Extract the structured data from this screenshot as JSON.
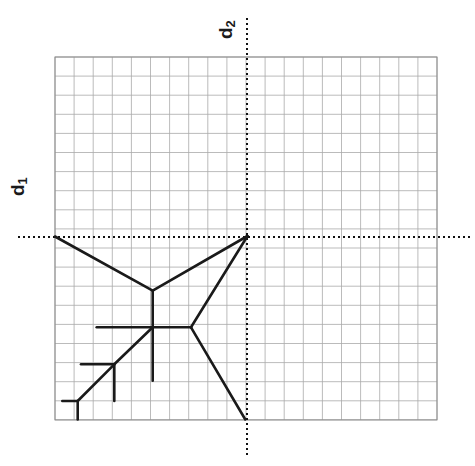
{
  "figure": {
    "width": 475,
    "height": 466,
    "background": "#ffffff",
    "grid": {
      "x0": 55,
      "y0": 57,
      "cell": 19.1,
      "cols": 20,
      "rows": 19,
      "line_color": "#a9a9a9",
      "line_width": 0.8,
      "border_color": "#8c8c8c",
      "border_width": 1.0,
      "visible": true
    },
    "axes": {
      "style": "dotted",
      "color": "#111111",
      "width": 2.0,
      "dash": "2,3",
      "vertical_x": 247,
      "horizontal_y": 237,
      "vertical_top": 18,
      "vertical_bottom": 455,
      "horizontal_left": 18,
      "horizontal_right": 470
    },
    "labels": {
      "d1": {
        "text": "d",
        "sub": "1",
        "rotated": true,
        "rotation_deg": -90
      },
      "d2": {
        "text": "d",
        "sub": "2",
        "rotated": true,
        "rotation_deg": -90
      }
    },
    "diagram": {
      "stroke_color": "#1a1a1a",
      "stroke_width": 2.6,
      "description": "piecewise-linear cell-boundary skeleton in third quadrant"
    }
  },
  "chart_data": {
    "type": "line",
    "title": "",
    "subtitle": "",
    "xlabel": "d2",
    "ylabel": "d1",
    "legend": [],
    "grid": true,
    "grid_cols": 20,
    "grid_rows": 19,
    "axis_origin_px": [
      247,
      237
    ],
    "axis_origin_cell": [
      10.05,
      9.42
    ],
    "xlim_px": [
      55,
      437
    ],
    "ylim_px": [
      57,
      419
    ],
    "annotations": [
      {
        "text": "d1",
        "role": "vertical-axis-label",
        "px": [
          18,
          222
        ]
      },
      {
        "text": "d2",
        "role": "horizontal-axis-label",
        "px": [
          230,
          30
        ]
      }
    ],
    "nodes": [
      {
        "id": "origin",
        "px": [
          247.5,
          236.0
        ],
        "label": ""
      },
      {
        "id": "upper-junction",
        "px": [
          152.7,
          290.7
        ],
        "label": ""
      },
      {
        "id": "center-junction",
        "px": [
          152.7,
          327.3
        ],
        "label": ""
      },
      {
        "id": "right-junction",
        "px": [
          191.0,
          327.3
        ],
        "label": ""
      },
      {
        "id": "lower-left-junction",
        "px": [
          114.3,
          364.3
        ],
        "label": ""
      },
      {
        "id": "bottom-left-junction",
        "px": [
          77.7,
          401.0
        ],
        "label": ""
      }
    ],
    "segments": [
      {
        "name": "edge-left-to-upper",
        "points": [
          [
            55.0,
            236.5
          ],
          [
            152.7,
            290.7
          ]
        ]
      },
      {
        "name": "edge-upper-to-origin",
        "points": [
          [
            152.7,
            290.7
          ],
          [
            247.5,
            236.0
          ]
        ]
      },
      {
        "name": "edge-upper-to-center",
        "points": [
          [
            152.7,
            290.7
          ],
          [
            152.7,
            327.3
          ]
        ]
      },
      {
        "name": "edge-right-to-origin",
        "points": [
          [
            191.0,
            327.3
          ],
          [
            247.5,
            236.0
          ]
        ]
      },
      {
        "name": "edge-center-to-right",
        "points": [
          [
            152.7,
            327.3
          ],
          [
            191.0,
            327.3
          ]
        ]
      },
      {
        "name": "edge-center-to-left-stub",
        "points": [
          [
            152.7,
            327.3
          ],
          [
            96.7,
            327.3
          ]
        ]
      },
      {
        "name": "edge-center-down-stub",
        "points": [
          [
            152.7,
            327.3
          ],
          [
            152.7,
            380.7
          ]
        ]
      },
      {
        "name": "edge-center-to-lowerleft",
        "points": [
          [
            152.7,
            327.3
          ],
          [
            114.3,
            364.3
          ]
        ]
      },
      {
        "name": "edge-lowerleft-to-bottomleft",
        "points": [
          [
            114.3,
            364.3
          ],
          [
            77.7,
            401.0
          ]
        ]
      },
      {
        "name": "edge-lowerleft-left-stub",
        "points": [
          [
            114.3,
            364.3
          ],
          [
            81.0,
            364.3
          ]
        ]
      },
      {
        "name": "edge-lowerleft-down-stub",
        "points": [
          [
            114.3,
            364.3
          ],
          [
            114.3,
            401.0
          ]
        ]
      },
      {
        "name": "edge-bottomleft-left-stub",
        "points": [
          [
            77.7,
            401.0
          ],
          [
            62.3,
            401.0
          ]
        ]
      },
      {
        "name": "edge-bottomleft-down-stub",
        "points": [
          [
            77.7,
            401.0
          ],
          [
            77.7,
            419.5
          ]
        ]
      },
      {
        "name": "edge-right-to-bottom",
        "points": [
          [
            191.0,
            327.3
          ],
          [
            245.3,
            419.5
          ]
        ]
      }
    ]
  }
}
